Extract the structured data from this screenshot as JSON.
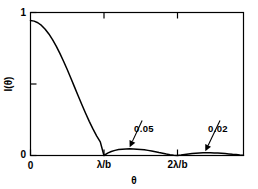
{
  "chart_data": {
    "type": "line",
    "title": "",
    "subtitle": "",
    "xlabel": "θ",
    "ylabel": "I(θ)",
    "xlim": [
      0,
      2.9
    ],
    "ylim": [
      0,
      1.06
    ],
    "grid": false,
    "legend": "none",
    "x_unit": "λ/b",
    "x_ticks": [
      {
        "value": 0,
        "label": "0"
      },
      {
        "value": 1,
        "label": "λ/b"
      },
      {
        "value": 2,
        "label": "2λ/b"
      }
    ],
    "y_ticks": [
      {
        "value": 0,
        "label": "0"
      },
      {
        "value": 0.5,
        "label": ""
      },
      {
        "value": 1,
        "label": "1"
      }
    ],
    "series": [
      {
        "name": "I(θ)",
        "description": "Single-slit diffraction intensity, sinc-squared envelope",
        "color": "#000000",
        "x": [
          0.0,
          0.05,
          0.1,
          0.15,
          0.2,
          0.25,
          0.3,
          0.35,
          0.4,
          0.45,
          0.5,
          0.55,
          0.6,
          0.65,
          0.7,
          0.75,
          0.8,
          0.85,
          0.9,
          0.95,
          1.0,
          1.05,
          1.1,
          1.15,
          1.2,
          1.25,
          1.3,
          1.35,
          1.4,
          1.45,
          1.5,
          1.55,
          1.6,
          1.65,
          1.7,
          1.75,
          1.8,
          1.85,
          1.9,
          1.95,
          2.0,
          2.05,
          2.1,
          2.15,
          2.2,
          2.25,
          2.3,
          2.35,
          2.4,
          2.45,
          2.5,
          2.55,
          2.6,
          2.65,
          2.7,
          2.75,
          2.8,
          2.85,
          2.9
        ],
        "y": [
          1.0,
          0.996,
          0.984,
          0.964,
          0.936,
          0.901,
          0.859,
          0.811,
          0.757,
          0.699,
          0.637,
          0.573,
          0.507,
          0.441,
          0.376,
          0.313,
          0.253,
          0.197,
          0.146,
          0.101,
          0.0,
          0.018,
          0.03,
          0.038,
          0.044,
          0.047,
          0.049,
          0.05,
          0.049,
          0.047,
          0.045,
          0.042,
          0.038,
          0.033,
          0.028,
          0.022,
          0.017,
          0.011,
          0.006,
          0.002,
          0.0,
          0.003,
          0.007,
          0.011,
          0.014,
          0.017,
          0.019,
          0.02,
          0.02,
          0.02,
          0.019,
          0.018,
          0.016,
          0.014,
          0.012,
          0.009,
          0.007,
          0.004,
          0.002
        ]
      }
    ],
    "annotations": [
      {
        "label": "0.05",
        "value": 0.05,
        "points_to_x": 1.35,
        "points_to_y": 0.05,
        "text_x": 1.52,
        "text_y": 0.26
      },
      {
        "label": "0.02",
        "value": 0.02,
        "points_to_x": 2.38,
        "points_to_y": 0.02,
        "text_x": 2.58,
        "text_y": 0.26
      }
    ]
  }
}
